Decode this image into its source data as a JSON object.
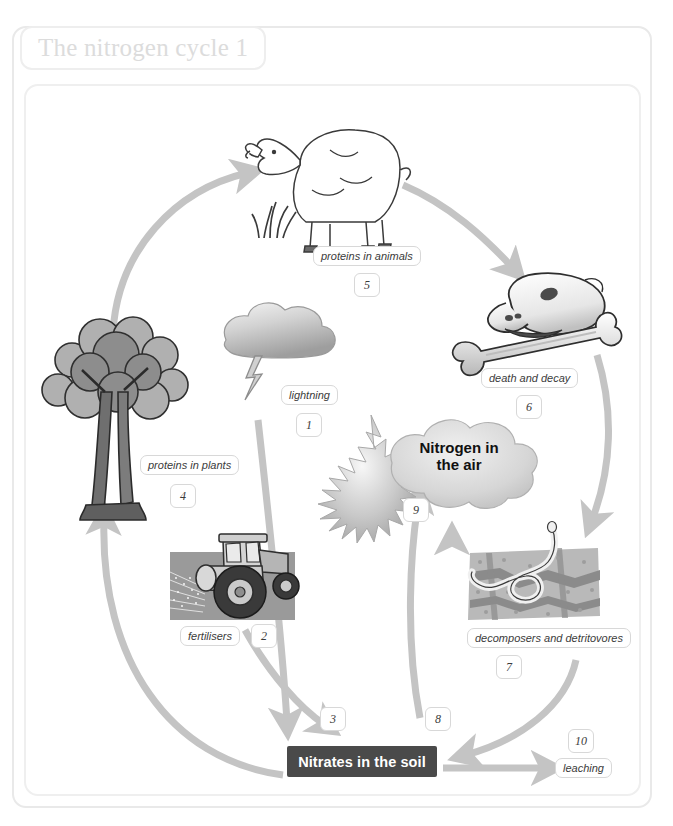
{
  "page": {
    "title": "The nitrogen cycle 1"
  },
  "colors": {
    "arrow": "#c4c4c4",
    "chip_border": "#d8d8d8",
    "nitrates_box_bg": "#4a4a4a",
    "nitrates_text": "#ffffff",
    "title_text": "#dcdcdc",
    "frame_border": "#e9e9e9",
    "tree_foliage_light": "#b4b4b4",
    "tree_foliage_dark": "#8e8e8e",
    "tree_trunk": "#6e6e6e",
    "cloud": "#cfcfcf",
    "soil": "#b9b9b9",
    "field": "#9a9a9a"
  },
  "diagram": {
    "type": "cycle-diagram",
    "central_node": "Nitrates in the soil",
    "air_node": "Nitrogen in the air",
    "labels": [
      {
        "id": 1,
        "text": "lightning",
        "number": "1",
        "icon": "lightning-cloud-icon"
      },
      {
        "id": 2,
        "text": "fertilisers",
        "number": "2",
        "icon": "tractor-icon"
      },
      {
        "id": 3,
        "text": "",
        "number": "3",
        "icon": ""
      },
      {
        "id": 4,
        "text": "proteins in plants",
        "number": "4",
        "icon": "tree-icon"
      },
      {
        "id": 5,
        "text": "proteins in animals",
        "number": "5",
        "icon": "sheep-icon"
      },
      {
        "id": 6,
        "text": "death and decay",
        "number": "6",
        "icon": "skull-and-bone-icon"
      },
      {
        "id": 7,
        "text": "decomposers and detritovores",
        "number": "7",
        "icon": "soil-worm-icon"
      },
      {
        "id": 8,
        "text": "",
        "number": "8",
        "icon": ""
      },
      {
        "id": 9,
        "text": "",
        "number": "9",
        "icon": "cloud-burst-icon"
      },
      {
        "id": 10,
        "text": "leaching",
        "number": "10",
        "icon": ""
      }
    ],
    "nodes": {
      "nitrates": "Nitrates in the soil",
      "air_line1": "Nitrogen in",
      "air_line2": "the air",
      "proteins_plants": "proteins in plants",
      "proteins_animals": "proteins in animals",
      "death_decay": "death and decay",
      "decomposers": "decomposers and detritovores",
      "lightning": "lightning",
      "fertilisers": "fertilisers",
      "leaching": "leaching"
    },
    "numbers": {
      "n1": "1",
      "n2": "2",
      "n3": "3",
      "n4": "4",
      "n5": "5",
      "n6": "6",
      "n7": "7",
      "n8": "8",
      "n9": "9",
      "n10": "10"
    }
  }
}
